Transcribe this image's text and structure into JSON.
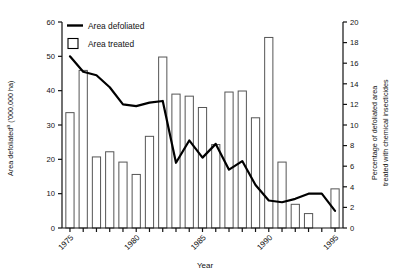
{
  "chart_data": {
    "type": "bar",
    "title": "",
    "xlabel": "Year",
    "ylabel": "Area defoliatedᵃ ('000,000 ha)",
    "ylabel_main": "Area defoliated",
    "ylabel_superscript": "a",
    "ylabel_units": "('000,000 ha)",
    "y2label_line1": "Percentage of defoliated area",
    "y2label_line2": "treated with chemical insecticides",
    "ylim": [
      0,
      60
    ],
    "yticks": [
      0,
      10,
      20,
      30,
      40,
      50,
      60
    ],
    "y2lim": [
      0,
      20
    ],
    "y2ticks": [
      0,
      2,
      4,
      6,
      8,
      10,
      12,
      14,
      16,
      18,
      20
    ],
    "xlim": [
      1974.4,
      1995.6
    ],
    "xticks": [
      1975,
      1976,
      1977,
      1978,
      1979,
      1980,
      1981,
      1982,
      1983,
      1984,
      1985,
      1986,
      1987,
      1988,
      1989,
      1990,
      1991,
      1992,
      1993,
      1994,
      1995
    ],
    "xtick_labels_shown": [
      "1975",
      "1980",
      "1985",
      "1990",
      "1995"
    ],
    "grid": false,
    "legend_position": "top-left-inside",
    "categories": [
      1975,
      1976,
      1977,
      1978,
      1979,
      1980,
      1981,
      1982,
      1983,
      1984,
      1985,
      1986,
      1987,
      1988,
      1989,
      1990,
      1991,
      1992,
      1993,
      1994,
      1995
    ],
    "series": [
      {
        "name": "Area treated",
        "type": "bar",
        "axis": "right",
        "unit": "percent",
        "values": [
          11.2,
          15.3,
          6.9,
          7.4,
          6.4,
          5.2,
          8.9,
          16.6,
          13.0,
          12.8,
          11.7,
          8.1,
          13.2,
          13.3,
          10.7,
          18.5,
          6.4,
          2.3,
          1.4,
          0.0,
          3.8
        ]
      },
      {
        "name": "Area defoliated",
        "type": "line",
        "axis": "left",
        "unit": "000,000 ha",
        "values": [
          50.0,
          45.5,
          44.5,
          41.0,
          36.0,
          35.5,
          36.5,
          37.0,
          19.0,
          25.5,
          20.5,
          24.5,
          17.0,
          19.5,
          12.5,
          8.0,
          7.5,
          8.5,
          10.0,
          10.0,
          5.0
        ]
      }
    ],
    "legend": [
      {
        "label": "Area defoliated",
        "marker": "line"
      },
      {
        "label": "Area treated",
        "marker": "square"
      }
    ],
    "colors": {
      "line": "#000000",
      "bar_stroke": "#555555",
      "bar_fill": "#ffffff",
      "axis": "#111111",
      "background": "#ffffff"
    }
  }
}
